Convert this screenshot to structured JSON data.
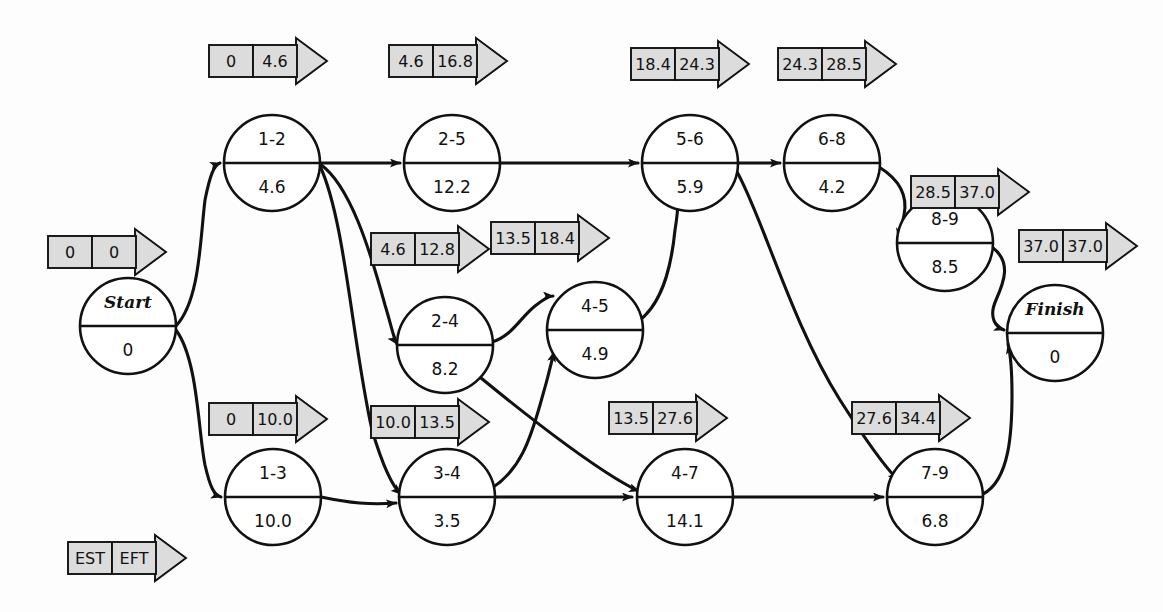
{
  "diagram": {
    "type": "project-network-diagram",
    "colors": {
      "tag_fill": "#dcdcdc",
      "line": "#111111",
      "node_fill": "#ffffff",
      "background": "#fdfdfd"
    },
    "legend": {
      "est_label": "EST",
      "eft_label": "EFT"
    },
    "nodes": [
      {
        "id": "start",
        "activity": "Start",
        "duration": "0",
        "cx": 128,
        "cy": 326,
        "r": 48,
        "terminal": true
      },
      {
        "id": "n1-2",
        "activity": "1-2",
        "duration": "4.6",
        "cx": 272,
        "cy": 163,
        "r": 48,
        "terminal": false
      },
      {
        "id": "n2-5",
        "activity": "2-5",
        "duration": "12.2",
        "cx": 452,
        "cy": 163,
        "r": 48,
        "terminal": false
      },
      {
        "id": "n5-6",
        "activity": "5-6",
        "duration": "5.9",
        "cx": 690,
        "cy": 163,
        "r": 48,
        "terminal": false
      },
      {
        "id": "n6-8",
        "activity": "6-8",
        "duration": "4.2",
        "cx": 832,
        "cy": 163,
        "r": 48,
        "terminal": false
      },
      {
        "id": "n8-9",
        "activity": "8-9",
        "duration": "8.5",
        "cx": 945,
        "cy": 243,
        "r": 48,
        "terminal": false
      },
      {
        "id": "n2-4",
        "activity": "2-4",
        "duration": "8.2",
        "cx": 445,
        "cy": 345,
        "r": 48,
        "terminal": false
      },
      {
        "id": "n4-5",
        "activity": "4-5",
        "duration": "4.9",
        "cx": 595,
        "cy": 330,
        "r": 48,
        "terminal": false
      },
      {
        "id": "finish",
        "activity": "Finish",
        "duration": "0",
        "cx": 1055,
        "cy": 333,
        "r": 48,
        "terminal": true
      },
      {
        "id": "n1-3",
        "activity": "1-3",
        "duration": "10.0",
        "cx": 273,
        "cy": 497,
        "r": 48,
        "terminal": false
      },
      {
        "id": "n3-4",
        "activity": "3-4",
        "duration": "3.5",
        "cx": 447,
        "cy": 497,
        "r": 48,
        "terminal": false
      },
      {
        "id": "n4-7",
        "activity": "4-7",
        "duration": "14.1",
        "cx": 685,
        "cy": 497,
        "r": 48,
        "terminal": false
      },
      {
        "id": "n7-9",
        "activity": "7-9",
        "duration": "6.8",
        "cx": 935,
        "cy": 497,
        "r": 48,
        "terminal": false
      }
    ],
    "tags": [
      {
        "id": "tag-start",
        "for": "start",
        "est": "0",
        "eft": "0",
        "x": 48,
        "y": 236
      },
      {
        "id": "tag-1-2",
        "for": "n1-2",
        "est": "0",
        "eft": "4.6",
        "x": 209,
        "y": 45
      },
      {
        "id": "tag-2-5",
        "for": "n2-5",
        "est": "4.6",
        "eft": "16.8",
        "x": 389,
        "y": 45
      },
      {
        "id": "tag-5-6",
        "for": "n5-6",
        "est": "18.4",
        "eft": "24.3",
        "x": 631,
        "y": 48
      },
      {
        "id": "tag-6-8",
        "for": "n6-8",
        "est": "24.3",
        "eft": "28.5",
        "x": 778,
        "y": 48
      },
      {
        "id": "tag-8-9",
        "for": "n8-9",
        "est": "28.5",
        "eft": "37.0",
        "x": 911,
        "y": 176
      },
      {
        "id": "tag-finish",
        "for": "finish",
        "est": "37.0",
        "eft": "37.0",
        "x": 1019,
        "y": 230
      },
      {
        "id": "tag-2-4",
        "for": "n2-4",
        "est": "4.6",
        "eft": "12.8",
        "x": 371,
        "y": 233
      },
      {
        "id": "tag-4-5",
        "for": "n4-5",
        "est": "13.5",
        "eft": "18.4",
        "x": 491,
        "y": 222
      },
      {
        "id": "tag-1-3",
        "for": "n1-3",
        "est": "0",
        "eft": "10.0",
        "x": 209,
        "y": 403
      },
      {
        "id": "tag-3-4",
        "for": "n3-4",
        "est": "10.0",
        "eft": "13.5",
        "x": 371,
        "y": 406
      },
      {
        "id": "tag-4-7",
        "for": "n4-7",
        "est": "13.5",
        "eft": "27.6",
        "x": 609,
        "y": 402
      },
      {
        "id": "tag-7-9",
        "for": "n7-9",
        "est": "27.6",
        "eft": "34.4",
        "x": 852,
        "y": 402
      },
      {
        "id": "tag-legend",
        "for": "legend",
        "est": "EST",
        "eft": "EFT",
        "x": 68,
        "y": 542
      }
    ],
    "edges": [
      {
        "id": "e-start-1-2",
        "from": "start",
        "to": "n1-2"
      },
      {
        "id": "e-start-1-3",
        "from": "start",
        "to": "n1-3"
      },
      {
        "id": "e-1-2-2-5",
        "from": "n1-2",
        "to": "n2-5"
      },
      {
        "id": "e-1-2-2-4",
        "from": "n1-2",
        "to": "n2-4"
      },
      {
        "id": "e-1-2-3-4",
        "from": "n1-2",
        "to": "n3-4"
      },
      {
        "id": "e-2-5-5-6",
        "from": "n2-5",
        "to": "n5-6"
      },
      {
        "id": "e-5-6-6-8",
        "from": "n5-6",
        "to": "n6-8"
      },
      {
        "id": "e-6-8-8-9",
        "from": "n6-8",
        "to": "n8-9"
      },
      {
        "id": "e-8-9-finish",
        "from": "n8-9",
        "to": "finish"
      },
      {
        "id": "e-2-4-4-5",
        "from": "n2-4",
        "to": "n4-5"
      },
      {
        "id": "e-2-4-4-7",
        "from": "n2-4",
        "to": "n4-7"
      },
      {
        "id": "e-4-5-5-6",
        "from": "n4-5",
        "to": "n5-6"
      },
      {
        "id": "e-1-3-3-4",
        "from": "n1-3",
        "to": "n3-4"
      },
      {
        "id": "e-3-4-4-5",
        "from": "n3-4",
        "to": "n4-5"
      },
      {
        "id": "e-3-4-4-7",
        "from": "n3-4",
        "to": "n4-7"
      },
      {
        "id": "e-4-7-7-9",
        "from": "n4-7",
        "to": "n7-9"
      },
      {
        "id": "e-5-6-7-9",
        "from": "n5-6",
        "to": "n7-9"
      },
      {
        "id": "e-7-9-finish",
        "from": "n7-9",
        "to": "finish"
      }
    ]
  }
}
